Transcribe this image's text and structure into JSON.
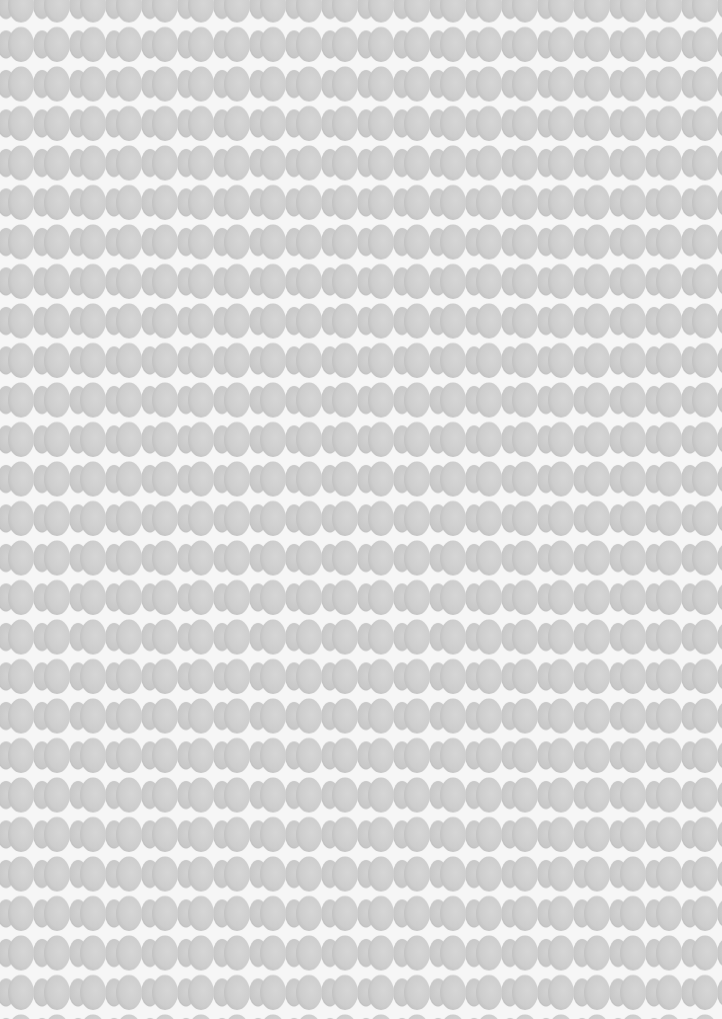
{
  "texture": {
    "description": "Repeating pattern of overlapping gray ovals on white paper",
    "background_color": "#f6f6f6",
    "oval_color": "#cfcfcf",
    "oval_shade_color": "#bdbdbd",
    "row_pitch_px": 39.5,
    "column_pitch_px": 36
  }
}
